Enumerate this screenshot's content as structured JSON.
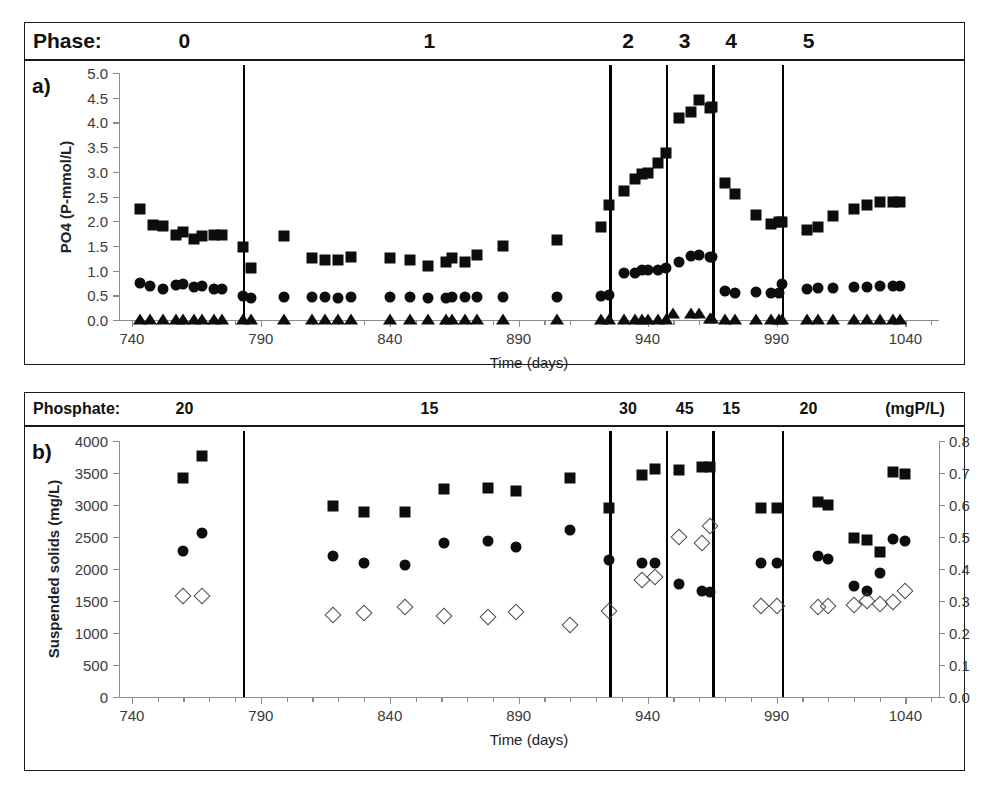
{
  "figure": {
    "phase_banner": {
      "label": "Phase:",
      "cells": [
        {
          "text": "0",
          "x_day": 760
        },
        {
          "text": "1",
          "x_day": 855
        },
        {
          "text": "2",
          "x_day": 932
        },
        {
          "text": "3",
          "x_day": 954
        },
        {
          "text": "4",
          "x_day": 972
        },
        {
          "text": "5",
          "x_day": 1002
        }
      ]
    },
    "phosphate_banner": {
      "label": "Phosphate:",
      "unit": "(mgP/L)",
      "cells": [
        {
          "text": "20",
          "x_day": 760
        },
        {
          "text": "15",
          "x_day": 855
        },
        {
          "text": "30",
          "x_day": 932
        },
        {
          "text": "45",
          "x_day": 954
        },
        {
          "text": "15",
          "x_day": 972
        },
        {
          "text": "20",
          "x_day": 1002
        }
      ]
    },
    "panel_a_letter": "a)",
    "panel_b_letter": "b)"
  },
  "chart_data": [
    {
      "type": "scatter",
      "panel": "a",
      "title": "",
      "xlabel": "Time (days)",
      "ylabel": "PO4 (P-mmol/L)",
      "xlim": [
        735,
        1053
      ],
      "ylim": [
        0.0,
        5.0
      ],
      "xticks": [
        740,
        790,
        840,
        890,
        940,
        990,
        1040
      ],
      "yticks": [
        0.0,
        0.5,
        1.0,
        1.5,
        2.0,
        2.5,
        3.0,
        3.5,
        4.0,
        4.5,
        5.0
      ],
      "ytick_labels": [
        "0.0",
        "0.5",
        "1.0",
        "1.5",
        "2.0",
        "2.5",
        "3.0",
        "3.5",
        "4.0",
        "4.5",
        "5.0"
      ],
      "xtick_labels": [
        "740",
        "790",
        "840",
        "890",
        "940",
        "990",
        "1040"
      ],
      "grid": false,
      "minor_xtick_interval": 10,
      "phase_dividers": [
        783,
        925,
        947,
        965,
        992
      ],
      "series": [
        {
          "name": "PO4 square",
          "marker": "filled-square",
          "points": [
            [
              743,
              2.25
            ],
            [
              748,
              1.92
            ],
            [
              752,
              1.9
            ],
            [
              757,
              1.72
            ],
            [
              760,
              1.78
            ],
            [
              764,
              1.64
            ],
            [
              767,
              1.7
            ],
            [
              772,
              1.72
            ],
            [
              775,
              1.72
            ],
            [
              783,
              1.48
            ],
            [
              786,
              1.05
            ],
            [
              799,
              1.7
            ],
            [
              810,
              1.25
            ],
            [
              815,
              1.22
            ],
            [
              820,
              1.22
            ],
            [
              825,
              1.28
            ],
            [
              840,
              1.25
            ],
            [
              848,
              1.22
            ],
            [
              855,
              1.1
            ],
            [
              862,
              1.18
            ],
            [
              864,
              1.25
            ],
            [
              869,
              1.18
            ],
            [
              874,
              1.32
            ],
            [
              884,
              1.5
            ],
            [
              905,
              1.62
            ],
            [
              922,
              1.88
            ],
            [
              925,
              2.32
            ],
            [
              931,
              2.62
            ],
            [
              935,
              2.85
            ],
            [
              938,
              2.95
            ],
            [
              940,
              2.98
            ],
            [
              944,
              3.18
            ],
            [
              947,
              3.38
            ],
            [
              952,
              4.08
            ],
            [
              957,
              4.22
            ],
            [
              960,
              4.45
            ],
            [
              964,
              4.3
            ],
            [
              965,
              4.32
            ],
            [
              970,
              2.78
            ],
            [
              974,
              2.55
            ],
            [
              982,
              2.12
            ],
            [
              988,
              1.95
            ],
            [
              991,
              1.98
            ],
            [
              992,
              1.98
            ],
            [
              1002,
              1.82
            ],
            [
              1006,
              1.88
            ],
            [
              1012,
              2.1
            ],
            [
              1020,
              2.25
            ],
            [
              1025,
              2.32
            ],
            [
              1030,
              2.38
            ],
            [
              1035,
              2.38
            ],
            [
              1038,
              2.38
            ]
          ]
        },
        {
          "name": "PO4 circle",
          "marker": "filled-circle",
          "points": [
            [
              743,
              0.75
            ],
            [
              747,
              0.68
            ],
            [
              752,
              0.62
            ],
            [
              757,
              0.7
            ],
            [
              760,
              0.72
            ],
            [
              764,
              0.66
            ],
            [
              767,
              0.68
            ],
            [
              772,
              0.62
            ],
            [
              775,
              0.62
            ],
            [
              783,
              0.48
            ],
            [
              786,
              0.45
            ],
            [
              799,
              0.46
            ],
            [
              810,
              0.46
            ],
            [
              815,
              0.46
            ],
            [
              820,
              0.45
            ],
            [
              825,
              0.46
            ],
            [
              840,
              0.46
            ],
            [
              848,
              0.46
            ],
            [
              855,
              0.45
            ],
            [
              862,
              0.45
            ],
            [
              864,
              0.46
            ],
            [
              869,
              0.46
            ],
            [
              874,
              0.46
            ],
            [
              884,
              0.46
            ],
            [
              905,
              0.46
            ],
            [
              922,
              0.48
            ],
            [
              925,
              0.5
            ],
            [
              931,
              0.95
            ],
            [
              935,
              0.96
            ],
            [
              938,
              1.02
            ],
            [
              940,
              1.02
            ],
            [
              944,
              1.02
            ],
            [
              947,
              1.05
            ],
            [
              952,
              1.18
            ],
            [
              957,
              1.3
            ],
            [
              960,
              1.32
            ],
            [
              964,
              1.28
            ],
            [
              965,
              1.28
            ],
            [
              970,
              0.58
            ],
            [
              974,
              0.55
            ],
            [
              982,
              0.56
            ],
            [
              988,
              0.55
            ],
            [
              991,
              0.55
            ],
            [
              992,
              0.72
            ],
            [
              1002,
              0.62
            ],
            [
              1006,
              0.65
            ],
            [
              1012,
              0.65
            ],
            [
              1020,
              0.66
            ],
            [
              1025,
              0.66
            ],
            [
              1030,
              0.68
            ],
            [
              1035,
              0.68
            ],
            [
              1038,
              0.68
            ]
          ]
        },
        {
          "name": "PO4 triangle",
          "marker": "filled-triangle",
          "points": [
            [
              743,
              0.03
            ],
            [
              747,
              0.03
            ],
            [
              752,
              0.03
            ],
            [
              757,
              0.03
            ],
            [
              760,
              0.03
            ],
            [
              764,
              0.03
            ],
            [
              767,
              0.03
            ],
            [
              772,
              0.03
            ],
            [
              775,
              0.03
            ],
            [
              783,
              0.03
            ],
            [
              786,
              0.03
            ],
            [
              799,
              0.03
            ],
            [
              810,
              0.03
            ],
            [
              815,
              0.03
            ],
            [
              820,
              0.03
            ],
            [
              825,
              0.03
            ],
            [
              840,
              0.03
            ],
            [
              848,
              0.03
            ],
            [
              855,
              0.03
            ],
            [
              862,
              0.03
            ],
            [
              864,
              0.03
            ],
            [
              869,
              0.03
            ],
            [
              874,
              0.03
            ],
            [
              884,
              0.03
            ],
            [
              905,
              0.03
            ],
            [
              922,
              0.03
            ],
            [
              925,
              0.03
            ],
            [
              931,
              0.03
            ],
            [
              935,
              0.03
            ],
            [
              938,
              0.03
            ],
            [
              940,
              0.03
            ],
            [
              944,
              0.03
            ],
            [
              947,
              0.03
            ],
            [
              950,
              0.14
            ],
            [
              957,
              0.14
            ],
            [
              960,
              0.14
            ],
            [
              964,
              0.05
            ],
            [
              965,
              0.05
            ],
            [
              970,
              0.03
            ],
            [
              974,
              0.03
            ],
            [
              982,
              0.03
            ],
            [
              988,
              0.03
            ],
            [
              991,
              0.03
            ],
            [
              992,
              0.03
            ],
            [
              1002,
              0.03
            ],
            [
              1006,
              0.03
            ],
            [
              1012,
              0.03
            ],
            [
              1020,
              0.03
            ],
            [
              1025,
              0.03
            ],
            [
              1030,
              0.03
            ],
            [
              1035,
              0.03
            ],
            [
              1038,
              0.03
            ]
          ]
        }
      ]
    },
    {
      "type": "scatter",
      "panel": "b",
      "title": "",
      "xlabel": "Time (days)",
      "ylabel": "Suspended solids (mg/L)",
      "y2label": "ISS/TSS (mg/mg)",
      "xlim": [
        735,
        1053
      ],
      "ylim": [
        0,
        4000
      ],
      "y2lim": [
        0.0,
        0.8
      ],
      "xticks": [
        740,
        790,
        840,
        890,
        940,
        990,
        1040
      ],
      "yticks": [
        0,
        500,
        1000,
        1500,
        2000,
        2500,
        3000,
        3500,
        4000
      ],
      "ytick_labels": [
        "0",
        "500",
        "1000",
        "1500",
        "2000",
        "2500",
        "3000",
        "3500",
        "4000"
      ],
      "y2ticks": [
        0.0,
        0.1,
        0.2,
        0.3,
        0.4,
        0.5,
        0.6,
        0.7,
        0.8
      ],
      "y2tick_labels": [
        "0.0",
        "0.1",
        "0.2",
        "0.3",
        "0.4",
        "0.5",
        "0.6",
        "0.7",
        "0.8"
      ],
      "xtick_labels": [
        "740",
        "790",
        "840",
        "890",
        "940",
        "990",
        "1040"
      ],
      "grid": false,
      "minor_xtick_interval": 10,
      "phase_dividers": [
        783,
        925,
        947,
        965,
        992
      ],
      "series": [
        {
          "name": "TSS square",
          "marker": "filled-square",
          "axis": "left",
          "points": [
            [
              760,
              3420
            ],
            [
              767,
              3760
            ],
            [
              818,
              2980
            ],
            [
              830,
              2890
            ],
            [
              846,
              2890
            ],
            [
              861,
              3250
            ],
            [
              878,
              3270
            ],
            [
              889,
              3220
            ],
            [
              910,
              3420
            ],
            [
              925,
              2960
            ],
            [
              938,
              3470
            ],
            [
              943,
              3560
            ],
            [
              952,
              3550
            ],
            [
              961,
              3590
            ],
            [
              964,
              3600
            ],
            [
              984,
              2960
            ],
            [
              990,
              2950
            ],
            [
              1006,
              3040
            ],
            [
              1010,
              3000
            ],
            [
              1020,
              2490
            ],
            [
              1025,
              2460
            ],
            [
              1030,
              2260
            ],
            [
              1035,
              3520
            ],
            [
              1040,
              3480
            ]
          ]
        },
        {
          "name": "VSS circle",
          "marker": "filled-circle",
          "axis": "left",
          "points": [
            [
              760,
              2280
            ],
            [
              767,
              2560
            ],
            [
              818,
              2210
            ],
            [
              830,
              2100
            ],
            [
              846,
              2060
            ],
            [
              861,
              2410
            ],
            [
              878,
              2440
            ],
            [
              889,
              2350
            ],
            [
              910,
              2610
            ],
            [
              925,
              2140
            ],
            [
              938,
              2100
            ],
            [
              943,
              2100
            ],
            [
              952,
              1760
            ],
            [
              961,
              1650
            ],
            [
              964,
              1640
            ],
            [
              984,
              2090
            ],
            [
              990,
              2090
            ],
            [
              1006,
              2200
            ],
            [
              1010,
              2150
            ],
            [
              1020,
              1740
            ],
            [
              1025,
              1650
            ],
            [
              1030,
              1940
            ],
            [
              1035,
              2470
            ],
            [
              1040,
              2430
            ]
          ]
        },
        {
          "name": "ISS/TSS diamond",
          "marker": "open-diamond",
          "axis": "right",
          "points": [
            [
              760,
              0.315
            ],
            [
              767,
              0.315
            ],
            [
              818,
              0.255
            ],
            [
              830,
              0.262
            ],
            [
              846,
              0.282
            ],
            [
              861,
              0.254
            ],
            [
              878,
              0.25
            ],
            [
              889,
              0.266
            ],
            [
              910,
              0.224
            ],
            [
              925,
              0.27
            ],
            [
              938,
              0.365
            ],
            [
              943,
              0.375
            ],
            [
              952,
              0.5
            ],
            [
              961,
              0.48
            ],
            [
              964,
              0.535
            ],
            [
              984,
              0.285
            ],
            [
              990,
              0.285
            ],
            [
              1006,
              0.28
            ],
            [
              1010,
              0.285
            ],
            [
              1020,
              0.288
            ],
            [
              1025,
              0.3
            ],
            [
              1030,
              0.292
            ],
            [
              1035,
              0.298
            ],
            [
              1040,
              0.33
            ]
          ]
        }
      ]
    }
  ]
}
